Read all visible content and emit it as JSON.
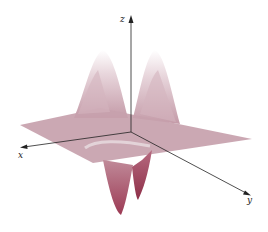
{
  "figure": {
    "axes": {
      "x_label": "x",
      "y_label": "y",
      "z_label": "z"
    },
    "colors": {
      "surface_light": "#f2e6ea",
      "surface_mid": "#c9a3ae",
      "plane": "#c29aa6",
      "trough_dark": "#a8485f",
      "axis": "#222222"
    }
  }
}
